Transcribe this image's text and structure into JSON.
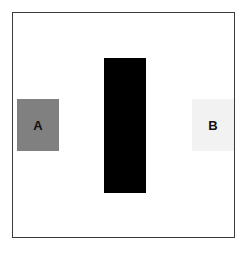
{
  "figure": {
    "background_color": "#ffffff",
    "panel": {
      "border_color": "#3b3b3b",
      "fill_color": "#ffffff"
    },
    "shapes": [
      {
        "name": "square-a",
        "label": "A",
        "fill_color": "#808080",
        "label_color": "#111111",
        "shape": "square"
      },
      {
        "name": "center-bar",
        "label": "",
        "fill_color": "#000000",
        "label_color": "#000000",
        "shape": "rectangle"
      },
      {
        "name": "square-b",
        "label": "B",
        "fill_color": "#f2f2f2",
        "label_color": "#111111",
        "shape": "square"
      }
    ]
  },
  "chart_data": {
    "type": "bar",
    "title": "",
    "subtitle": "",
    "xlabel": "",
    "ylabel": "",
    "grid": false,
    "legend": "none",
    "categories": [
      "A",
      "",
      "B"
    ],
    "values": [
      52,
      135,
      52
    ],
    "ylim": [
      0,
      226
    ],
    "series": [
      {
        "name": "blocks",
        "values": [
          52,
          135,
          52
        ],
        "colors": [
          "#808080",
          "#000000",
          "#f2f2f2"
        ]
      }
    ],
    "annotations": [
      "A",
      "B"
    ]
  }
}
